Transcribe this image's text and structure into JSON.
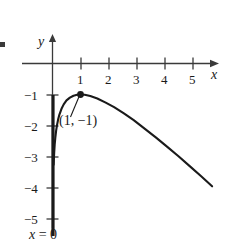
{
  "chart_data": {
    "type": "line",
    "title": "",
    "xlabel": "x",
    "ylabel": "y",
    "xlim": [
      -0.6,
      6.2
    ],
    "ylim": [
      -5.9,
      0.55
    ],
    "grid": false,
    "legend": null,
    "function": "y = ln(x) - x",
    "x_ticks": [
      "1",
      "2",
      "3",
      "4",
      "5"
    ],
    "x_tick_values": [
      1,
      2,
      3,
      4,
      5
    ],
    "y_ticks": [
      "−1",
      "−2",
      "−3",
      "−4",
      "−5"
    ],
    "y_tick_values": [
      -1,
      -2,
      -3,
      -4,
      -5
    ],
    "series": [
      {
        "name": "y = ln(x) - x",
        "x": [
          0.04,
          0.06,
          0.08,
          0.1,
          0.13,
          0.16,
          0.2,
          0.25,
          0.32,
          0.4,
          0.5,
          0.62,
          0.75,
          0.88,
          1.0,
          1.15,
          1.35,
          1.6,
          1.9,
          2.2,
          2.55,
          2.9,
          3.3,
          3.7,
          4.1,
          4.5,
          4.9,
          5.3,
          5.7
        ],
        "y": [
          -3.26,
          -2.87,
          -2.61,
          -2.4,
          -2.17,
          -1.99,
          -1.81,
          -1.64,
          -1.46,
          -1.32,
          -1.19,
          -1.1,
          -1.04,
          -1.01,
          -1.0,
          -1.01,
          -1.05,
          -1.13,
          -1.26,
          -1.41,
          -1.61,
          -1.83,
          -2.11,
          -2.39,
          -2.69,
          -2.99,
          -3.31,
          -3.63,
          -3.96
        ]
      }
    ],
    "annotations": [
      {
        "name": "maximum-point",
        "label": "(1, −1)",
        "x": 1,
        "y": -1,
        "marker": "filled-dot",
        "label_position": "below-left",
        "leader_line": true
      },
      {
        "name": "vertical-asymptote",
        "label": "x = 0",
        "label_var": "x",
        "label_rest": "= 0",
        "x": 0,
        "style": "thick-solid"
      }
    ],
    "colors": {
      "curve": "#1a1a1a",
      "axis": "#3a3a3a",
      "asymptote": "#1a1a1a",
      "text": "#1a1a1a",
      "background": "#ffffff"
    }
  },
  "axes": {
    "x_label": "x",
    "y_label": "y"
  },
  "labels": {
    "x_tick_1": "1",
    "x_tick_2": "2",
    "x_tick_3": "3",
    "x_tick_4": "4",
    "x_tick_5": "5",
    "y_tick_1": "−1",
    "y_tick_2": "−2",
    "y_tick_3": "−3",
    "y_tick_4": "−4",
    "y_tick_5": "−5",
    "point_label": "(1, −1)",
    "asymptote_var": "x",
    "asymptote_rest": "= 0"
  }
}
